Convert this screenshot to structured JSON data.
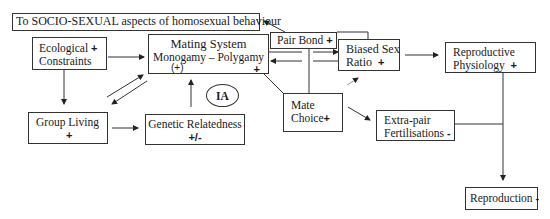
{
  "diagram": {
    "title_box": {
      "label": "To SOCIO-SEXUAL aspects of homosexual behaviour"
    },
    "nodes": {
      "ecological": {
        "line1": "Ecological",
        "sign": "+",
        "line2": "Constraints"
      },
      "mating_system": {
        "line1": "Mating System",
        "line2": "Monogamy – Polygamy",
        "sign_left": "(+)",
        "sign_right": "+"
      },
      "pair_bond": {
        "label": "Pair Bond",
        "sign": "+"
      },
      "biased_sex_ratio": {
        "line1": "Biased Sex",
        "line2": "Ratio",
        "sign": "+"
      },
      "reproductive_physiology": {
        "line1": "Reproductive",
        "line2": "Physiology",
        "sign": "+"
      },
      "mate_choice": {
        "line1": "Mate",
        "line2": "Choice",
        "sign": "+"
      },
      "extra_pair": {
        "line1": "Extra-pair",
        "line2": "Fertilisations",
        "sign": "-"
      },
      "group_living": {
        "line1": "Group Living",
        "sign": "+"
      },
      "genetic_relatedness": {
        "line1": "Genetic Relatedness",
        "sign": "+/-"
      },
      "reproduction": {
        "label": "Reproduction",
        "sign": "-"
      },
      "ia": {
        "label": "IA"
      }
    },
    "edges": [
      {
        "from": "Pair Bond",
        "to": "To SOCIO-SEXUAL aspects of homosexual behaviour"
      },
      {
        "from": "Ecological Constraints",
        "to": "Mating System"
      },
      {
        "from": "Ecological Constraints",
        "to": "Group Living"
      },
      {
        "from": "Group Living",
        "to": "Mating System"
      },
      {
        "from": "Mating System",
        "to": "Group Living"
      },
      {
        "from": "Group Living",
        "to": "Genetic Relatedness"
      },
      {
        "from": "Genetic Relatedness",
        "to": "Mating System",
        "label": "IA"
      },
      {
        "from": "Mating System",
        "to": "Biased Sex Ratio"
      },
      {
        "from": "Biased Sex Ratio",
        "to": "Mating System"
      },
      {
        "from": "Mating System",
        "to": "Mate Choice"
      },
      {
        "from": "Pair Bond",
        "to": "Mate Choice"
      },
      {
        "from": "Mate Choice",
        "to": "Biased Sex Ratio"
      },
      {
        "from": "Mate Choice",
        "to": "Extra-pair Fertilisations"
      },
      {
        "from": "Biased Sex Ratio",
        "to": "Reproductive Physiology"
      },
      {
        "from": "Reproductive Physiology",
        "to": "Reproduction"
      },
      {
        "from": "Extra-pair Fertilisations",
        "to": "Reproduction"
      }
    ]
  }
}
